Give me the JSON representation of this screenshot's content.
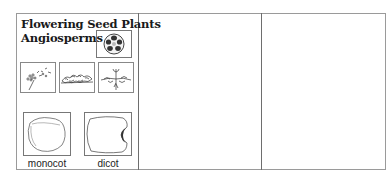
{
  "card": {
    "title_line1": "Flowering Seed Plants",
    "title_line2": "Angiosperms",
    "flower_icon": "flower-illustration-icon",
    "habit_sketches": [
      {
        "icon": "dandelion-sketch-icon"
      },
      {
        "icon": "shrub-sketch-icon"
      },
      {
        "icon": "creeping-plant-sketch-icon"
      }
    ],
    "seeds": [
      {
        "label": "monocot",
        "icon": "monocot-seed-icon"
      },
      {
        "label": "dicot",
        "icon": "dicot-seed-icon"
      }
    ]
  },
  "columns": [
    {
      "name": "blank-column-2",
      "content": ""
    },
    {
      "name": "blank-column-3",
      "content": ""
    }
  ],
  "colors": {
    "border": "#9a9a9a",
    "divider": "#6e6e6e",
    "text": "#1a1a1a",
    "embryo": "#333333"
  }
}
